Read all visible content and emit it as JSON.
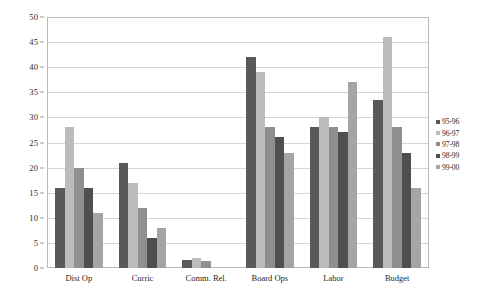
{
  "chart_data": {
    "type": "bar",
    "title": "",
    "subtitle": "",
    "xlabel": "",
    "ylabel": "",
    "ylim": [
      0,
      50
    ],
    "y_ticks": [
      0,
      5,
      10,
      15,
      20,
      25,
      30,
      35,
      40,
      45,
      50
    ],
    "grid": true,
    "legend_position": "right",
    "categories": [
      "Dist Op",
      "Curric",
      "Comm. Rel.",
      "Board Ops",
      "Labor",
      "Budget"
    ],
    "series": [
      {
        "name": "95-96",
        "color": "#595959",
        "values": [
          16,
          21,
          1.5,
          42,
          28,
          33.5
        ]
      },
      {
        "name": "96-97",
        "color": "#bcbcbc",
        "values": [
          28,
          17,
          2,
          39,
          30,
          46
        ]
      },
      {
        "name": "97-98",
        "color": "#8f8f8f",
        "values": [
          20,
          12,
          1.3,
          28,
          28,
          28
        ]
      },
      {
        "name": "98-99",
        "color": "#4f4f4f",
        "values": [
          16,
          6,
          0,
          26,
          27,
          23
        ]
      },
      {
        "name": "99-00",
        "color": "#a5a5a5",
        "values": [
          11,
          8,
          0,
          23,
          37,
          16
        ]
      }
    ]
  }
}
